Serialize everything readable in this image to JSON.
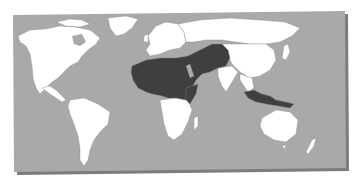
{
  "map": {
    "subject": "World map with highlighted region",
    "colors": {
      "background": "#ffffff",
      "ocean": "#a9a9a9",
      "land": "#ffffff",
      "highlight": "#3f3f3f",
      "border": "#8c8c8c",
      "shadow": "#7a7a7a"
    },
    "highlighted_regions": [
      "North Africa",
      "Sahel / West Africa",
      "Horn of Africa",
      "Middle East",
      "Turkey",
      "Central Asia",
      "Pakistan / Afghanistan",
      "Indonesia / Malaysia"
    ],
    "unhighlighted_regions": [
      "North America",
      "Greenland",
      "South America",
      "Europe",
      "Russia",
      "China / East Asia",
      "India",
      "Southern Africa",
      "Australia",
      "New Zealand"
    ]
  }
}
